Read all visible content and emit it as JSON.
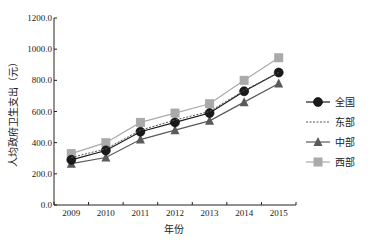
{
  "chart_data": {
    "type": "line",
    "title": "",
    "xlabel": "年份",
    "ylabel": "人均政府卫生支出（元）",
    "ylim": [
      0,
      1200
    ],
    "yticks": [
      0,
      200,
      400,
      600,
      800,
      1000,
      1200
    ],
    "ytick_labels": [
      "0.0",
      "200.0",
      "400.0",
      "600.0",
      "800.0",
      "1000.0",
      "1200.0"
    ],
    "categories": [
      "2009",
      "2010",
      "2011",
      "2012",
      "2013",
      "2014",
      "2015"
    ],
    "grid": false,
    "legend_position": "right",
    "series": [
      {
        "name": "全国",
        "color": "#1a1a1a",
        "line_style": "solid",
        "marker": "circle",
        "values": [
          290,
          350,
          470,
          530,
          590,
          730,
          850
        ]
      },
      {
        "name": "东部",
        "color": "#555555",
        "line_style": "dashed",
        "marker": "none",
        "values": [
          305,
          360,
          480,
          545,
          600,
          735,
          850
        ]
      },
      {
        "name": "中部",
        "color": "#5a5a5a",
        "line_style": "solid",
        "marker": "triangle",
        "values": [
          265,
          305,
          420,
          480,
          540,
          660,
          780
        ]
      },
      {
        "name": "西部",
        "color": "#aaaaaa",
        "line_style": "solid",
        "marker": "square",
        "values": [
          330,
          400,
          530,
          590,
          650,
          800,
          945
        ]
      }
    ]
  }
}
